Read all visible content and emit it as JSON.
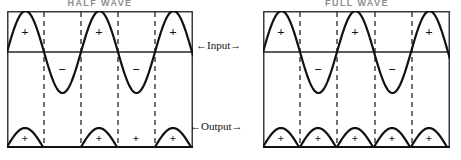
{
  "figure": {
    "kind": "waveform-rectification-diagram",
    "background": "#ffffff",
    "ink": "#111111"
  },
  "panels": [
    {
      "id": "half-wave",
      "title": "HALF WAVE",
      "title_left": 24,
      "title_width": 152,
      "box": {
        "x": 7,
        "y": 11,
        "w": 186,
        "h": 137
      },
      "zero_line_y": 52,
      "output_baseline_y": 147,
      "dashed_x": [
        44,
        81,
        118,
        155
      ],
      "input": {
        "cycles": 3,
        "period": 74,
        "amplitude": 41,
        "start_x": 7,
        "positive_marks": [
          {
            "x": 25,
            "label": "+"
          },
          {
            "x": 99,
            "label": "+"
          },
          {
            "x": 173,
            "label": "+"
          }
        ],
        "negative_marks": [
          {
            "x": 62,
            "label": "−"
          },
          {
            "x": 136,
            "label": "−"
          }
        ]
      },
      "output": {
        "description": "half-wave rectified: only positive half cycles, gaps between humps",
        "humps": [
          {
            "x": 25,
            "halfwidth": 18,
            "height": 19,
            "label": "+"
          },
          {
            "x": 99,
            "halfwidth": 18,
            "height": 19,
            "label": "+"
          },
          {
            "x": 173,
            "halfwidth": 18,
            "height": 19,
            "label": "+"
          }
        ],
        "extra_marks": [
          {
            "x": 136,
            "label": "+"
          }
        ]
      }
    },
    {
      "id": "full-wave",
      "title": "FULL WAVE",
      "title_left": 281,
      "title_width": 152,
      "box": {
        "x": 263,
        "y": 11,
        "w": 187,
        "h": 137
      },
      "zero_line_y": 52,
      "output_baseline_y": 147,
      "dashed_x": [
        300,
        337,
        375,
        412
      ],
      "input": {
        "cycles": 3,
        "period": 74,
        "amplitude": 41,
        "start_x": 263,
        "positive_marks": [
          {
            "x": 281,
            "label": "+"
          },
          {
            "x": 355,
            "label": "+"
          },
          {
            "x": 429,
            "label": "+"
          }
        ],
        "negative_marks": [
          {
            "x": 318,
            "label": "−"
          },
          {
            "x": 392,
            "label": "−"
          }
        ]
      },
      "output": {
        "description": "full-wave rectified: every half cycle flipped positive, humps touch",
        "humps": [
          {
            "x": 281,
            "halfwidth": 18,
            "height": 19,
            "label": "+"
          },
          {
            "x": 318,
            "halfwidth": 18,
            "height": 19,
            "label": "+"
          },
          {
            "x": 355,
            "halfwidth": 18,
            "height": 19,
            "label": "+"
          },
          {
            "x": 392,
            "halfwidth": 18,
            "height": 19,
            "label": "+"
          },
          {
            "x": 429,
            "halfwidth": 18,
            "height": 19,
            "label": "+"
          }
        ],
        "extra_marks": []
      }
    }
  ],
  "annotations": {
    "input_label": "←Input→",
    "output_label": "←Output→"
  }
}
